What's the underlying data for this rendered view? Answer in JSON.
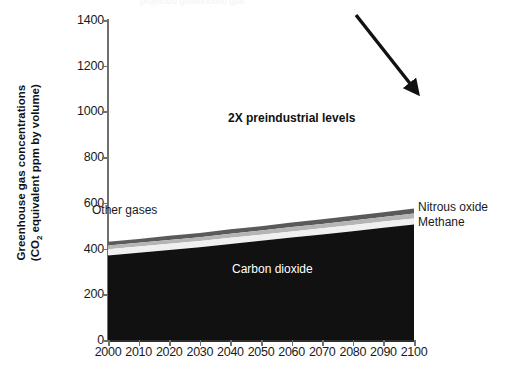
{
  "figure": {
    "clipped_header_text": "projected greenhouse gas",
    "annotation": "2X preindustrial levels"
  },
  "axes": {
    "ylabel_line1": "Greenhouse gas concentrations",
    "ylabel_line2_pre": "(CO",
    "ylabel_line2_sub": "2",
    "ylabel_line2_post": " equivalent ppm by volume)",
    "yticks": [
      "0",
      "200",
      "400",
      "600",
      "800",
      "1000",
      "1200",
      "1400"
    ],
    "xticks": [
      "2000",
      "2010",
      "2020",
      "2030",
      "2040",
      "2050",
      "2060",
      "2070",
      "2080",
      "2090",
      "2100"
    ]
  },
  "series_labels": {
    "other_gases": "Other gases",
    "carbon_dioxide": "Carbon dioxide",
    "nitrous_oxide": "Nitrous oxide",
    "methane": "Methane"
  },
  "colors": {
    "carbon_dioxide": "#111111",
    "methane": "#f0f0f0",
    "other_gases": "#b5b5b5",
    "nitrous_oxide": "#5a5a5a",
    "axis": "#707070",
    "text": "#1a1a1a"
  },
  "chart_data": {
    "type": "area",
    "stacked": true,
    "title": "",
    "xlabel": "",
    "ylabel": "Greenhouse gas concentrations (CO2 equivalent ppm by volume)",
    "xlim": [
      2000,
      2100
    ],
    "ylim": [
      0,
      1400
    ],
    "ytick_step": 200,
    "xtick_step": 10,
    "grid": false,
    "legend_position": "inline-annotations",
    "x": [
      2000,
      2010,
      2020,
      2030,
      2040,
      2050,
      2060,
      2070,
      2080,
      2090,
      2100
    ],
    "series": [
      {
        "name": "Carbon dioxide",
        "color": "#111111",
        "values": [
          370,
          382,
          394,
          406,
          420,
          434,
          448,
          462,
          476,
          491,
          505
        ]
      },
      {
        "name": "Methane",
        "color": "#f0f0f0",
        "values": [
          27,
          27,
          27,
          27,
          27,
          27,
          27,
          27,
          27,
          27,
          27
        ]
      },
      {
        "name": "Other gases",
        "color": "#b5b5b5",
        "values": [
          16,
          16,
          17,
          17,
          18,
          18,
          19,
          19,
          20,
          20,
          21
        ]
      },
      {
        "name": "Nitrous oxide",
        "color": "#5a5a5a",
        "values": [
          17,
          17,
          18,
          18,
          19,
          19,
          20,
          20,
          21,
          21,
          22
        ]
      }
    ],
    "stack_totals": [
      430,
      442,
      456,
      468,
      484,
      498,
      514,
      528,
      544,
      559,
      575
    ],
    "annotations": [
      {
        "text": "2X preindustrial levels",
        "points_to_x": 2100,
        "points_to_y": 575
      }
    ]
  }
}
